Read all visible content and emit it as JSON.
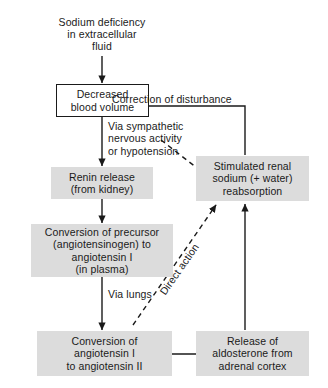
{
  "diagram": {
    "background_color": "#ffffff",
    "shaded_node_color": "#dcdcdc",
    "line_color": "#1a1a1a",
    "nodes": [
      {
        "id": "sodium-deficiency",
        "label": "Sodium deficiency\nin extracellular\nfluid",
        "style": "plain"
      },
      {
        "id": "decreased-blood-volume",
        "label": "Decreased\nblood volume",
        "style": "outlined"
      },
      {
        "id": "renin-release",
        "label": "Renin release\n(from kidney)",
        "style": "shaded"
      },
      {
        "id": "conversion-precursor",
        "label": "Conversion of precursor\n(angiotensinogen) to\nangiotensin I\n(in plasma)",
        "style": "shaded"
      },
      {
        "id": "conversion-angiotensin",
        "label": "Conversion of\nangiotensin I\nto angiotensin II",
        "style": "shaded"
      },
      {
        "id": "aldosterone-release",
        "label": "Release of\naldosterone from\nadrenal cortex",
        "style": "shaded"
      },
      {
        "id": "stimulated-reabsorption",
        "label": "Stimulated renal\nsodium (+ water)\nreabsorption",
        "style": "shaded"
      }
    ],
    "edge_labels": [
      {
        "id": "correction-of-disturbance",
        "text": "Correction of disturbance"
      },
      {
        "id": "via-sympathetic",
        "text": "Via sympathetic\nnervous activity\nor hypotension"
      },
      {
        "id": "via-lungs",
        "text": "Via lungs"
      },
      {
        "id": "direct-action",
        "text": "Direct action"
      }
    ]
  }
}
